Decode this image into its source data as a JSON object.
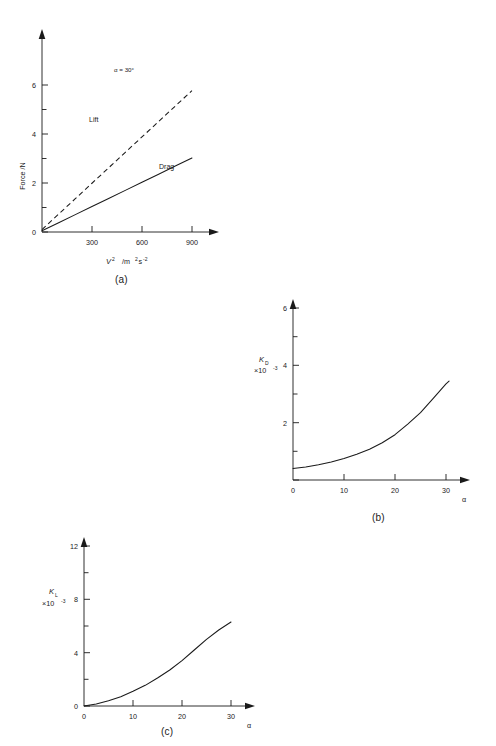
{
  "figure": {
    "panels": [
      {
        "caption": "(a)",
        "annotation": "α = 30°",
        "series_labels": {
          "lift": "Lift",
          "drag": "Drag"
        }
      },
      {
        "caption": "(b)"
      },
      {
        "caption": "(c)"
      }
    ]
  },
  "chart_data": [
    {
      "type": "line",
      "panel": "(a)",
      "title": "",
      "xlabel": "V² /m²s⁻²",
      "xlabel_parts": {
        "symbol": "V",
        "exponent": "2",
        "units": "/m",
        "units_exp": "2",
        "units_s": "s",
        "units_s_exp": "-2"
      },
      "ylabel": "Force /N",
      "xlim": [
        0,
        1000
      ],
      "ylim": [
        0,
        6.6
      ],
      "xticks": [
        300,
        600,
        900
      ],
      "xtick_labels": [
        "300",
        "600",
        "900"
      ],
      "yticks": [
        0,
        2,
        4,
        6
      ],
      "ytick_labels": [
        "0",
        "2",
        "4",
        "6"
      ],
      "yminorticks": [
        1,
        3,
        5
      ],
      "grid": false,
      "legend": "inline-labels",
      "annotations": [
        {
          "text": "α = 30°",
          "x": 520,
          "y": 5.85
        },
        {
          "text": "Lift",
          "x": 330,
          "y": 4.55
        },
        {
          "text": "Drag",
          "x": 740,
          "y": 2.45
        }
      ],
      "series": [
        {
          "name": "Lift",
          "style": "dashed",
          "x": [
            0,
            100,
            200,
            300,
            400,
            500,
            600,
            700,
            800,
            900
          ],
          "values": [
            0.1,
            0.73,
            1.36,
            1.99,
            2.62,
            3.25,
            3.88,
            4.51,
            5.14,
            5.77
          ]
        },
        {
          "name": "Drag",
          "style": "solid",
          "x": [
            0,
            100,
            200,
            300,
            400,
            500,
            600,
            700,
            800,
            900
          ],
          "values": [
            0.05,
            0.38,
            0.71,
            1.04,
            1.37,
            1.7,
            2.03,
            2.36,
            2.69,
            3.02
          ]
        }
      ]
    },
    {
      "type": "line",
      "panel": "(b)",
      "title": "",
      "xlabel": "α",
      "ylabel": "K_D ×10⁻³",
      "ylabel_parts": {
        "symbol": "K",
        "subscript": "D",
        "factor": "×10",
        "factor_exp": "-3"
      },
      "xlim": [
        0,
        33
      ],
      "ylim": [
        0,
        6.8
      ],
      "xticks": [
        0,
        10,
        20,
        30
      ],
      "xtick_labels": [
        "0",
        "10",
        "20",
        "30"
      ],
      "yticks": [
        0,
        2,
        4,
        6
      ],
      "ytick_labels": [
        "0",
        "2",
        "4",
        "6"
      ],
      "yminorticks": [
        1,
        3,
        5
      ],
      "grid": false,
      "series": [
        {
          "name": "K_D",
          "style": "solid",
          "x": [
            0,
            2.5,
            5,
            7.5,
            10,
            12.5,
            15,
            17.5,
            20,
            22.5,
            25,
            27.5,
            30,
            30.6
          ],
          "values": [
            0.4,
            0.45,
            0.53,
            0.63,
            0.75,
            0.9,
            1.07,
            1.3,
            1.58,
            1.95,
            2.35,
            2.85,
            3.35,
            3.45
          ]
        }
      ]
    },
    {
      "type": "line",
      "panel": "(c)",
      "title": "",
      "xlabel": "α",
      "ylabel": "K_L ×10⁻³",
      "ylabel_parts": {
        "symbol": "K",
        "subscript": "L",
        "factor": "×10",
        "factor_exp": "-3"
      },
      "xlim": [
        0,
        33
      ],
      "ylim": [
        0,
        13.2
      ],
      "xticks": [
        0,
        10,
        20,
        30
      ],
      "xtick_labels": [
        "0",
        "10",
        "20",
        "30"
      ],
      "yticks": [
        0,
        4,
        8,
        12
      ],
      "ytick_labels": [
        "0",
        "4",
        "8",
        "12"
      ],
      "yminorticks": [
        2,
        6,
        10
      ],
      "grid": false,
      "series": [
        {
          "name": "K_L",
          "style": "solid",
          "x": [
            0,
            2.5,
            5,
            7.5,
            10,
            12.5,
            15,
            17.5,
            20,
            22.5,
            25,
            27.5,
            30
          ],
          "values": [
            0.0,
            0.15,
            0.4,
            0.7,
            1.1,
            1.55,
            2.1,
            2.7,
            3.4,
            4.2,
            5.0,
            5.7,
            6.3
          ]
        }
      ]
    }
  ]
}
